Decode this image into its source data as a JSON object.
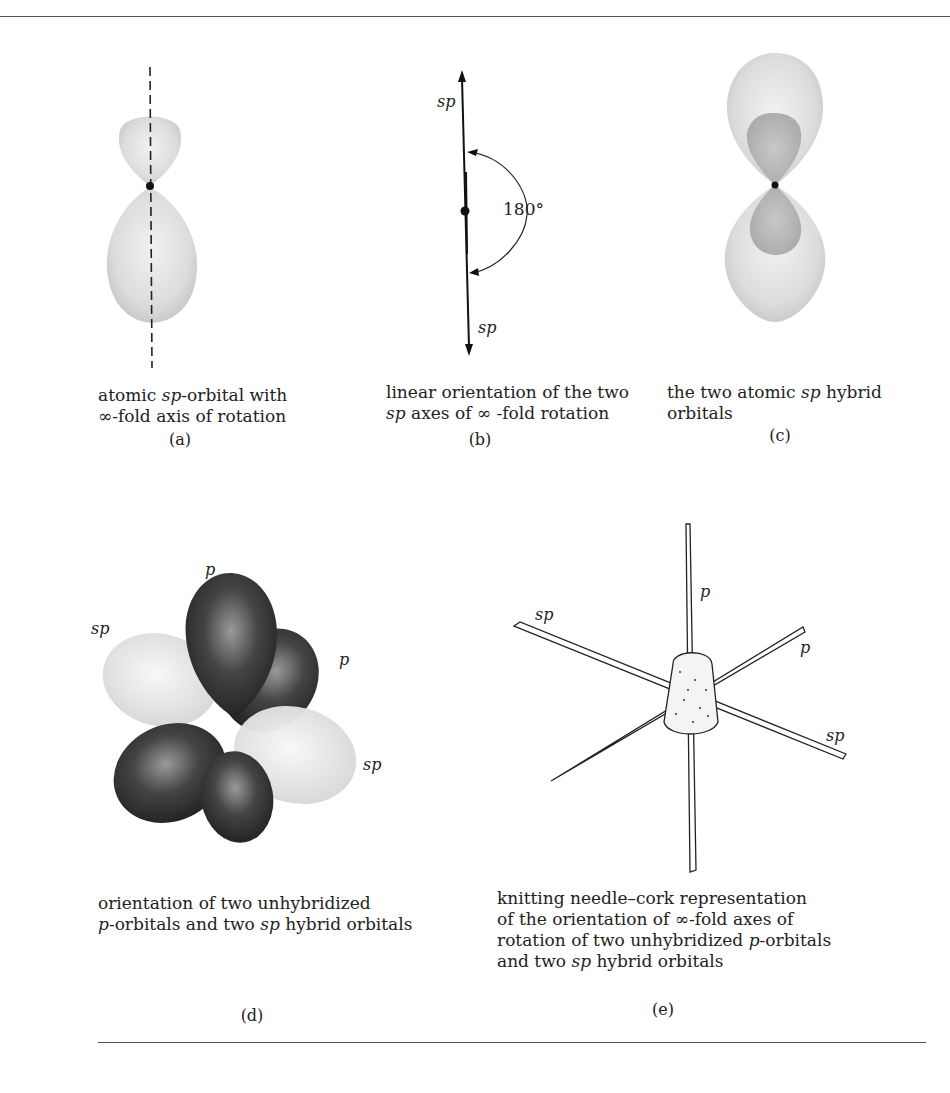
{
  "panels": {
    "a": {
      "letter": "(a)",
      "caption_line1_pre": "atomic ",
      "caption_line1_em": "sp",
      "caption_line1_post": "-orbital with",
      "caption_line2": "∞-fold axis of rotation"
    },
    "b": {
      "letter": "(b)",
      "label_top": "sp",
      "label_bottom": "sp",
      "angle_label": "180°",
      "caption_line1": "linear orientation of the two",
      "caption_line2_em": "sp",
      "caption_line2_post": " axes of ∞ -fold rotation"
    },
    "c": {
      "letter": "(c)",
      "caption_line1_pre": "the two atomic ",
      "caption_line1_em": "sp",
      "caption_line1_post": " hybrid",
      "caption_line2": "orbitals"
    },
    "d": {
      "letter": "(d)",
      "labels": {
        "p_top": "p",
        "p_right": "p",
        "sp_left": "sp",
        "sp_right": "sp"
      },
      "caption_line1": "orientation of  two unhybridized",
      "caption_line2_em": "p",
      "caption_line2_mid": "-orbitals and  two ",
      "caption_line2_em2": "sp",
      "caption_line2_post": " hybrid orbitals"
    },
    "e": {
      "letter": "(e)",
      "labels": {
        "p_top": "p",
        "p_right": "p",
        "sp_left": "sp",
        "sp_right": "sp"
      },
      "caption_line1": "knitting needle–cork representation",
      "caption_line2": "of the orientation of ∞-fold axes of",
      "caption_line3_pre": "rotation of two unhybridized ",
      "caption_line3_em": "p",
      "caption_line3_post": "-orbitals",
      "caption_line4_pre": "and two ",
      "caption_line4_em": "sp",
      "caption_line4_post": " hybrid orbitals"
    }
  }
}
